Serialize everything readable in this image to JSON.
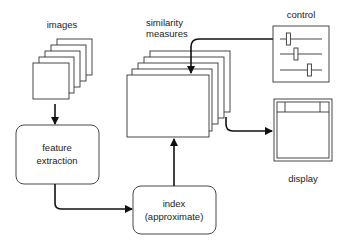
{
  "diagram": {
    "nodes": {
      "images": {
        "label": "images"
      },
      "similarity": {
        "label_line1": "similarity",
        "label_line2": "measures"
      },
      "control": {
        "label": "control",
        "slider_positions": [
          0.2,
          0.38,
          0.7
        ]
      },
      "display": {
        "label": "display"
      },
      "feature": {
        "label_line1": "feature",
        "label_line2": "extraction"
      },
      "index": {
        "label_line1": "index",
        "label_line2": "(approximate)"
      }
    },
    "edges": [
      {
        "from": "images",
        "to": "feature extraction"
      },
      {
        "from": "feature extraction",
        "to": "index (approximate)"
      },
      {
        "from": "index (approximate)",
        "to": "similarity measures"
      },
      {
        "from": "control",
        "to": "similarity measures"
      },
      {
        "from": "similarity measures",
        "to": "display"
      }
    ],
    "colors": {
      "stroke": "#333333",
      "arrow": "#111111",
      "background": "#ffffff"
    }
  }
}
